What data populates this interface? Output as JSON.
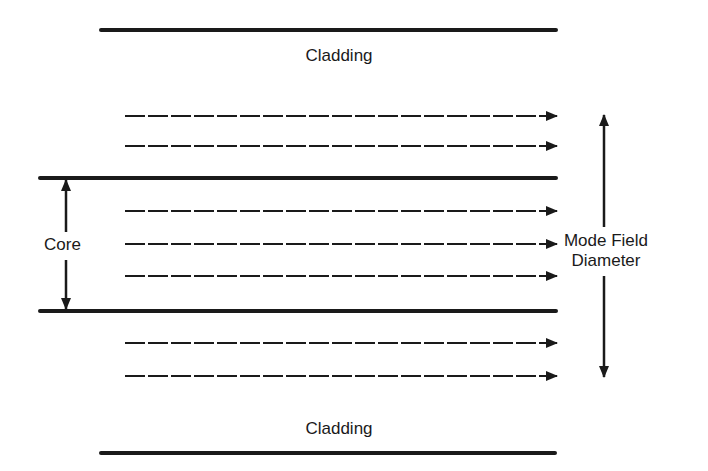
{
  "diagram": {
    "title": "",
    "labels": {
      "cladding_top": "Cladding",
      "cladding_bottom": "Cladding",
      "core": "Core",
      "mode_field_line1": "Mode Field",
      "mode_field_line2": "Diameter"
    },
    "elements": {
      "cladding_boundaries": [
        {
          "name": "top-cladding-line",
          "y": 30,
          "x1": 101,
          "x2": 556
        },
        {
          "name": "bottom-cladding-line",
          "y": 453,
          "x1": 101,
          "x2": 555
        }
      ],
      "core_boundaries": [
        {
          "name": "core-top-boundary",
          "y": 178,
          "x1": 40,
          "x2": 556
        },
        {
          "name": "core-bottom-boundary",
          "y": 311,
          "x1": 40,
          "x2": 556
        }
      ],
      "propagation_arrows": [
        {
          "y": 116
        },
        {
          "y": 146
        },
        {
          "y": 211
        },
        {
          "y": 244
        },
        {
          "y": 276
        },
        {
          "y": 343
        },
        {
          "y": 376
        }
      ],
      "core_dimension": {
        "x": 66,
        "y1": 178,
        "y2": 311
      },
      "mode_field_dimension": {
        "x": 604,
        "y1": 115,
        "y2": 377
      }
    },
    "colors": {
      "line": "#1a1a1a",
      "background": "#ffffff"
    }
  }
}
